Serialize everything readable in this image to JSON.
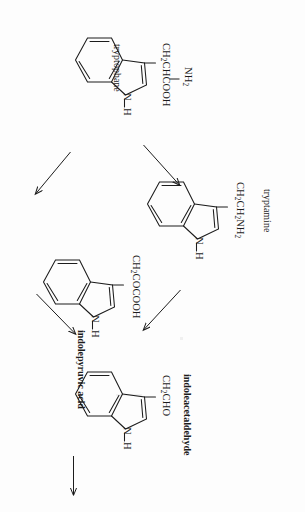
{
  "figure": {
    "orientation": "rotated-90-clockwise",
    "background_color": "#fdfdfd",
    "ink_color": "#1c1c1c"
  },
  "molecules": [
    {
      "id": "tryptophane",
      "name": "tryptophane",
      "name_bold": false,
      "side_chain_parts": [
        "CH",
        "2",
        "CHCOOH"
      ],
      "side_chain_plain": "CH2CHCOOH",
      "substituent_parts": [
        "NH",
        "2"
      ],
      "substituent_plain": "NH2",
      "ring_nh": "H",
      "ring_n": "N"
    },
    {
      "id": "tryptamine",
      "name": "tryptamine",
      "name_bold": false,
      "side_chain_parts": [
        "CH",
        "2",
        "CH",
        "2",
        "NH",
        "2"
      ],
      "side_chain_plain": "CH2CH2NH2",
      "ring_nh": "H",
      "ring_n": "N"
    },
    {
      "id": "indolepyruvic-acid",
      "name": "indolepyruvic acid",
      "name_bold": true,
      "side_chain_parts": [
        "CH",
        "2",
        "COCOOH"
      ],
      "side_chain_plain": "CH2COCOOH",
      "ring_nh": "H",
      "ring_n": "N"
    },
    {
      "id": "indoleacetaldehyde",
      "name": "indoleacetaldehyde",
      "name_bold": true,
      "side_chain_parts": [
        "CH",
        "2",
        "CHO"
      ],
      "side_chain_plain": "CH2CHO",
      "ring_nh": "H",
      "ring_n": "N"
    }
  ],
  "arrows": [
    {
      "id": "trp-to-tryptamine",
      "from": "tryptophane",
      "to": "tryptamine",
      "style": "solid-thin"
    },
    {
      "id": "trp-to-ipya",
      "from": "tryptophane",
      "to": "indolepyruvic-acid",
      "style": "solid-thin"
    },
    {
      "id": "tryptamine-to-iaald",
      "from": "tryptamine",
      "to": "indoleacetaldehyde",
      "style": "solid-thin"
    },
    {
      "id": "ipya-to-iaald",
      "from": "indolepyruvic-acid",
      "to": "indoleacetaldehyde",
      "style": "solid-thin"
    },
    {
      "id": "iaald-to-next",
      "from": "indoleacetaldehyde",
      "to": "",
      "style": "solid-horizontal"
    }
  ]
}
